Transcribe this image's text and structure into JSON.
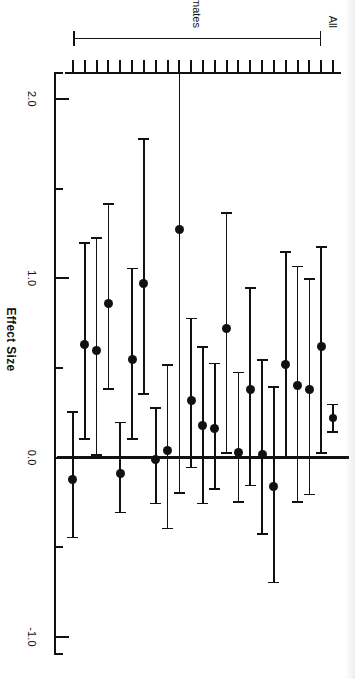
{
  "figure": {
    "kind": "forest-plot",
    "orientation": "rotated-90-clockwise",
    "background": "#ffffff",
    "ink_color": "#111111"
  },
  "axis": {
    "title": "Effect Size",
    "tick_labels": [
      "2.0",
      "1.0",
      "0.0",
      "-1.0"
    ],
    "tick_values": [
      2.0,
      1.0,
      0.0,
      -1.0
    ],
    "minor_ticks": [
      2.0,
      1.5,
      1.0,
      0.5,
      0.0,
      -0.5,
      -1.0
    ],
    "limits": [
      2.15,
      -1.1
    ],
    "reference_line": 0.0
  },
  "groups": [
    {
      "name": "All",
      "label": "All"
    },
    {
      "name": "Individual Trial Estimates",
      "label": "Individual Trial Estimates"
    }
  ],
  "chart_data": {
    "type": "scatter",
    "subtype": "forest-plot",
    "title": "",
    "xlabel": "Effect Size",
    "ylabel": "",
    "xlim": [
      2.15,
      -1.1
    ],
    "grid": false,
    "legend": false,
    "reference_line": 0.0,
    "axis_tick_labels": [
      "2.0",
      "1.0",
      "0.0",
      "-1.0"
    ],
    "marker": "filled-circle",
    "error_bars": "95% confidence interval",
    "categories": [
      "All",
      "Trial 1",
      "Trial 2",
      "Trial 3",
      "Trial 4",
      "Trial 5",
      "Trial 6",
      "Trial 7",
      "Trial 8",
      "Trial 9",
      "Trial 10",
      "Trial 11",
      "Trial 12",
      "Trial 13",
      "Trial 14",
      "Trial 15",
      "Trial 16",
      "Trial 17",
      "Trial 18",
      "Trial 19",
      "Trial 20",
      "Trial 21",
      "Trial 22"
    ],
    "series": [
      {
        "name": "Effect Size",
        "values": [
          0.22,
          0.62,
          0.38,
          0.4,
          0.52,
          -0.16,
          0.02,
          0.38,
          0.03,
          0.72,
          0.16,
          0.18,
          0.32,
          1.27,
          0.04,
          -0.01,
          0.97,
          0.55,
          -0.09,
          0.86,
          0.6,
          0.63,
          -0.12
        ],
        "ci_lower": [
          0.14,
          0.02,
          -0.21,
          -0.25,
          0.0,
          -0.7,
          -0.43,
          -0.16,
          -0.25,
          0.02,
          -0.18,
          -0.26,
          -0.06,
          -0.2,
          -0.4,
          -0.26,
          0.35,
          0.1,
          -0.31,
          0.38,
          0.01,
          0.1,
          -0.45
        ],
        "ci_upper": [
          0.3,
          1.18,
          1.0,
          1.07,
          1.15,
          0.4,
          0.55,
          0.95,
          0.48,
          1.37,
          0.53,
          0.62,
          0.78,
          2.15,
          0.52,
          0.28,
          1.78,
          1.06,
          0.2,
          1.42,
          1.23,
          1.2,
          0.26
        ]
      }
    ],
    "summary_row_index": 0
  },
  "rows": [
    {
      "label": "All",
      "group": "All",
      "effect": 0.22,
      "lower": 0.14,
      "upper": 0.3,
      "summary": true
    },
    {
      "label": "Trial 1",
      "group": "Individual Trial Estimates",
      "effect": 0.62,
      "lower": 0.02,
      "upper": 1.18,
      "summary": false
    },
    {
      "label": "Trial 2",
      "group": "Individual Trial Estimates",
      "effect": 0.38,
      "lower": -0.21,
      "upper": 1.0,
      "summary": false
    },
    {
      "label": "Trial 3",
      "group": "Individual Trial Estimates",
      "effect": 0.4,
      "lower": -0.25,
      "upper": 1.07,
      "summary": false
    },
    {
      "label": "Trial 4",
      "group": "Individual Trial Estimates",
      "effect": 0.52,
      "lower": 0.0,
      "upper": 1.15,
      "summary": false
    },
    {
      "label": "Trial 5",
      "group": "Individual Trial Estimates",
      "effect": -0.16,
      "lower": -0.7,
      "upper": 0.4,
      "summary": false
    },
    {
      "label": "Trial 6",
      "group": "Individual Trial Estimates",
      "effect": 0.02,
      "lower": -0.43,
      "upper": 0.55,
      "summary": false
    },
    {
      "label": "Trial 7",
      "group": "Individual Trial Estimates",
      "effect": 0.38,
      "lower": -0.16,
      "upper": 0.95,
      "summary": false
    },
    {
      "label": "Trial 8",
      "group": "Individual Trial Estimates",
      "effect": 0.03,
      "lower": -0.25,
      "upper": 0.48,
      "summary": false
    },
    {
      "label": "Trial 9",
      "group": "Individual Trial Estimates",
      "effect": 0.72,
      "lower": 0.02,
      "upper": 1.37,
      "summary": false
    },
    {
      "label": "Trial 10",
      "group": "Individual Trial Estimates",
      "effect": 0.16,
      "lower": -0.18,
      "upper": 0.53,
      "summary": false
    },
    {
      "label": "Trial 11",
      "group": "Individual Trial Estimates",
      "effect": 0.18,
      "lower": -0.26,
      "upper": 0.62,
      "summary": false
    },
    {
      "label": "Trial 12",
      "group": "Individual Trial Estimates",
      "effect": 0.32,
      "lower": -0.06,
      "upper": 0.78,
      "summary": false
    },
    {
      "label": "Trial 13",
      "group": "Individual Trial Estimates",
      "effect": 1.27,
      "lower": -0.2,
      "upper": 2.15,
      "summary": false
    },
    {
      "label": "Trial 14",
      "group": "Individual Trial Estimates",
      "effect": 0.04,
      "lower": -0.4,
      "upper": 0.52,
      "summary": false
    },
    {
      "label": "Trial 15",
      "group": "Individual Trial Estimates",
      "effect": -0.01,
      "lower": -0.26,
      "upper": 0.28,
      "summary": false
    },
    {
      "label": "Trial 16",
      "group": "Individual Trial Estimates",
      "effect": 0.97,
      "lower": 0.35,
      "upper": 1.78,
      "summary": false
    },
    {
      "label": "Trial 17",
      "group": "Individual Trial Estimates",
      "effect": 0.55,
      "lower": 0.1,
      "upper": 1.06,
      "summary": false
    },
    {
      "label": "Trial 18",
      "group": "Individual Trial Estimates",
      "effect": -0.09,
      "lower": -0.31,
      "upper": 0.2,
      "summary": false
    },
    {
      "label": "Trial 19",
      "group": "Individual Trial Estimates",
      "effect": 0.86,
      "lower": 0.38,
      "upper": 1.42,
      "summary": false
    },
    {
      "label": "Trial 20",
      "group": "Individual Trial Estimates",
      "effect": 0.6,
      "lower": 0.01,
      "upper": 1.23,
      "summary": false
    },
    {
      "label": "Trial 21",
      "group": "Individual Trial Estimates",
      "effect": 0.63,
      "lower": 0.1,
      "upper": 1.2,
      "summary": false
    },
    {
      "label": "Trial 22",
      "group": "Individual Trial Estimates",
      "effect": -0.12,
      "lower": -0.45,
      "upper": 0.26,
      "summary": false
    }
  ]
}
